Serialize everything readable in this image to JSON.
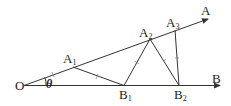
{
  "diagram": {
    "points": {
      "O": {
        "label": "O",
        "x": 24,
        "y": 85
      },
      "A": {
        "label": "A",
        "x": 208,
        "y": 19
      },
      "B": {
        "label": "B",
        "x": 220,
        "y": 86
      },
      "A1": {
        "label": "A",
        "sub": "1",
        "x": 73,
        "y": 67
      },
      "B1": {
        "label": "B",
        "sub": "1",
        "x": 124,
        "y": 85
      },
      "A2": {
        "label": "A",
        "sub": "2",
        "x": 150,
        "y": 39
      },
      "B2": {
        "label": "B",
        "sub": "2",
        "x": 179,
        "y": 85
      },
      "A3": {
        "label": "A",
        "sub": "3",
        "x": 174,
        "y": 30
      }
    },
    "angle_label": "θ",
    "segments_equal": [
      "OA1",
      "A1B1",
      "B1A2",
      "A2B2",
      "B2A3"
    ]
  }
}
